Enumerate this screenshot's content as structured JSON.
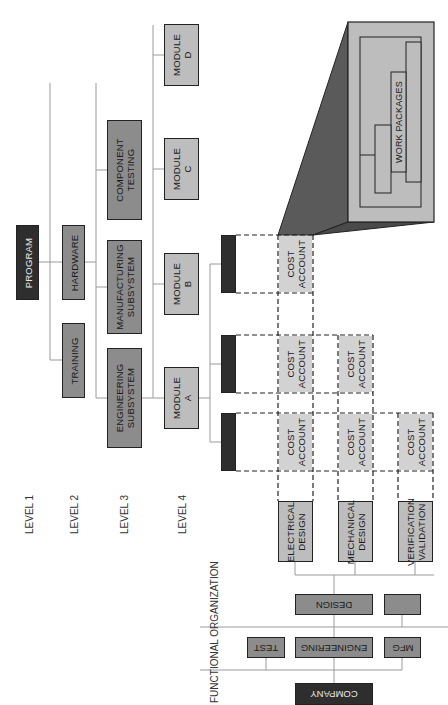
{
  "diagram": {
    "orientation": "rotated 90deg counterclockwise",
    "level_labels": [
      "LEVEL 1",
      "LEVEL 2",
      "LEVEL 3",
      "LEVEL 4"
    ],
    "functional_label": "FUNCTIONAL ORGANIZATION",
    "wbs": {
      "level1": "PROGRAM",
      "level2": [
        "HARDWARE",
        "TRAINING"
      ],
      "level3": [
        "COMPONENT\nTESTING",
        "MANUFACTURING\nSUBSYSTEM",
        "ENGINEERING\nSUBSYSTEM"
      ],
      "level4": [
        "MODULE\nD",
        "MODULE\nC",
        "MODULE\nB",
        "MODULE\nA"
      ]
    },
    "cost_account_label": "COST\nACCOUNT",
    "work_packages_label": "WORK PACKAGES",
    "functional": {
      "root": "COMPANY",
      "departments": [
        "TEST",
        "ENGINEERING",
        "MFG"
      ],
      "sub_departments": [
        "DESIGN",
        ""
      ],
      "design_groups": [
        "ELECTRICAL\nDESIGN",
        "MECHANICAL\nDESIGN",
        "VERIFICATION\nVALIDATION"
      ]
    },
    "colors": {
      "dark": "#2e2e2e",
      "mid": "#8c8c8c",
      "light": "#bdbdbd",
      "cost_fill": "#d2d2d2",
      "shadow": "#555555",
      "line": "#9a9a9a"
    }
  }
}
